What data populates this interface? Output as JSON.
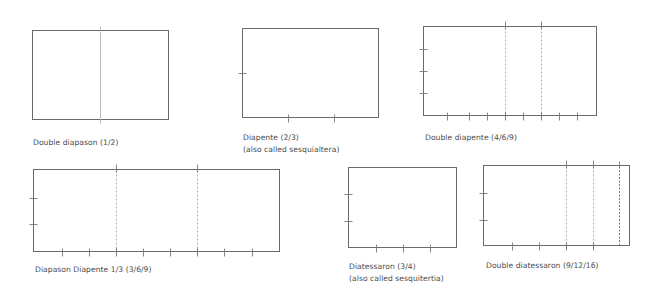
{
  "figures": [
    {
      "id": "double-diapason",
      "label": "Double diapason (1/2)",
      "rect": {
        "x": 32,
        "y": 30,
        "w": 136,
        "h": 89
      },
      "solid_dividers": [
        100
      ],
      "dashed_dividers": [],
      "dark_dashed_dividers": [],
      "left_ticks": [],
      "bottom_ticks": [],
      "label_pos": {
        "x": 33,
        "y": 137
      }
    },
    {
      "id": "diapente",
      "label": "Diapente (2/3)",
      "sublabel": "(also called sesquialtera)",
      "rect": {
        "x": 242,
        "y": 28,
        "w": 136,
        "h": 89
      },
      "solid_dividers": [],
      "dashed_dividers": [],
      "dark_dashed_dividers": [],
      "left_ticks": [
        73
      ],
      "bottom_ticks": [
        288,
        334
      ],
      "label_pos": {
        "x": 243,
        "y": 132
      }
    },
    {
      "id": "double-diapente",
      "label": "Double diapente (4/6/9)",
      "rect": {
        "x": 423,
        "y": 26,
        "w": 173,
        "h": 89
      },
      "solid_dividers": [],
      "dashed_dividers": [
        505,
        541
      ],
      "dark_dashed_dividers": [],
      "left_ticks": [
        49,
        71,
        93
      ],
      "bottom_ticks": [
        447,
        469,
        487,
        505,
        523,
        541,
        559,
        577
      ],
      "label_pos": {
        "x": 425,
        "y": 132
      }
    },
    {
      "id": "diapason-diapente",
      "label": "Diapason Diapente 1/3 (3/6/9)",
      "rect": {
        "x": 33,
        "y": 169,
        "w": 246,
        "h": 82
      },
      "solid_dividers": [],
      "dashed_dividers": [
        116,
        197
      ],
      "dark_dashed_dividers": [],
      "left_ticks": [
        198,
        224
      ],
      "bottom_ticks": [
        62,
        89,
        116,
        143,
        170,
        197,
        224,
        252
      ],
      "label_pos": {
        "x": 35,
        "y": 264
      }
    },
    {
      "id": "diatessaron",
      "label": "Diatessaron (3/4)",
      "sublabel": "(also called sesquitertia)",
      "rect": {
        "x": 348,
        "y": 167,
        "w": 108,
        "h": 80
      },
      "solid_dividers": [],
      "dashed_dividers": [],
      "dark_dashed_dividers": [],
      "left_ticks": [
        194,
        221
      ],
      "bottom_ticks": [
        376,
        403,
        430
      ],
      "label_pos": {
        "x": 349,
        "y": 261
      }
    },
    {
      "id": "double-diatessaron",
      "label": "Double diatessaron (9/12/16)",
      "rect": {
        "x": 483,
        "y": 165,
        "w": 146,
        "h": 80
      },
      "solid_dividers": [],
      "dashed_dividers": [
        566,
        593
      ],
      "dark_dashed_dividers": [
        619
      ],
      "left_ticks": [
        193,
        220
      ],
      "bottom_ticks": [
        512,
        539,
        566,
        593
      ],
      "label_pos": {
        "x": 486,
        "y": 260
      }
    }
  ],
  "colors": {
    "outline": "#6a6a6a",
    "tick": "#7a7a7a",
    "dashed": "#a8a8a8",
    "text": "#4a4a4a"
  }
}
